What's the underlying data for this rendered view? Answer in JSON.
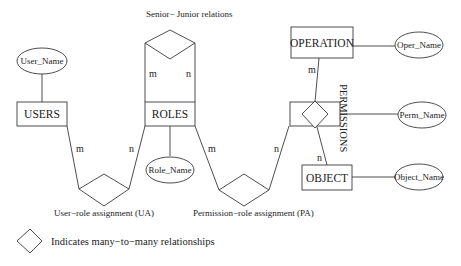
{
  "diagram": {
    "type": "entity-relationship",
    "entities": {
      "users": "USERS",
      "roles": "ROLES",
      "operation": "OPERATION",
      "object": "OBJECT"
    },
    "attributes": {
      "user_name": "User_Name",
      "role_name": "Role_Name",
      "oper_name": "Oper_Name",
      "perm_name": "Perm_Name",
      "object_name": "Object_Name"
    },
    "relationships": {
      "senior_junior": "Senior− Junior relations",
      "ua": "User−role assignment (UA)",
      "pa": "Permission−role  assignment (PA)",
      "permissions": "PERMISSIONS"
    },
    "cardinalities": {
      "sj_left": "m",
      "sj_right": "n",
      "ua_users": "m",
      "ua_roles": "n",
      "pa_roles": "m",
      "pa_perm": "n",
      "perm_operation": "m",
      "perm_object": "n"
    },
    "legend": {
      "text": "Indicates  many−to−many relationships"
    }
  }
}
